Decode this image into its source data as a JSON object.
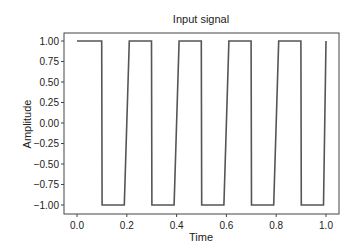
{
  "chart_data": {
    "type": "line",
    "title": "Input signal",
    "xlabel": "Time",
    "ylabel": "Amplitude",
    "xlim": [
      -0.04,
      1.03
    ],
    "ylim": [
      -1.1,
      1.1
    ],
    "xticks": [
      0.0,
      0.2,
      0.4,
      0.6,
      0.8,
      1.0
    ],
    "xtick_labels": [
      "0.0",
      "0.2",
      "0.4",
      "0.6",
      "0.8",
      "1.0"
    ],
    "yticks": [
      1.0,
      0.75,
      0.5,
      0.25,
      0.0,
      -0.25,
      -0.5,
      -0.75,
      -1.0
    ],
    "ytick_labels": [
      "1.00",
      "0.75",
      "0.50",
      "0.25",
      "0.00",
      "−0.25",
      "−0.50",
      "−0.75",
      "−1.00"
    ],
    "grid": false,
    "legend": null,
    "series": [
      {
        "name": "square wave",
        "color": "#555555",
        "x": [
          0.0,
          0.099,
          0.101,
          0.19,
          0.21,
          0.299,
          0.301,
          0.39,
          0.41,
          0.499,
          0.501,
          0.59,
          0.61,
          0.699,
          0.701,
          0.79,
          0.81,
          0.899,
          0.901,
          0.99,
          1.0
        ],
        "y": [
          1,
          1,
          -1,
          -1,
          1,
          1,
          -1,
          -1,
          1,
          1,
          -1,
          -1,
          1,
          1,
          -1,
          -1,
          1,
          1,
          -1,
          -1,
          1
        ]
      }
    ],
    "annotations": []
  }
}
